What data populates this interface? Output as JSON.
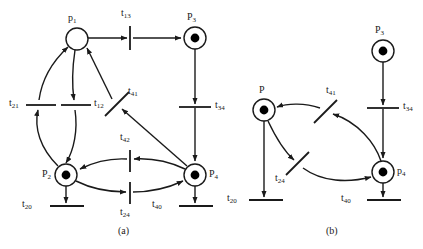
{
  "figure": {
    "type": "petri-net-diagram",
    "width": 423,
    "height": 249,
    "background": "#ffffff",
    "stroke_color": "#1a1a1a",
    "token_color": "#000000"
  },
  "panels": [
    {
      "id": "a",
      "caption": "(a)",
      "caption_pos": {
        "x": 120,
        "y": 232
      },
      "places": [
        {
          "id": "p1",
          "label": "p",
          "sub": "1",
          "cx": 77,
          "cy": 39,
          "r": 11,
          "tokens": 0,
          "label_pos": {
            "x": 68,
            "y": 16
          }
        },
        {
          "id": "p3",
          "label": "P",
          "sub": "3",
          "cx": 195,
          "cy": 38,
          "r": 11,
          "tokens": 1,
          "label_pos": {
            "x": 187,
            "y": 15
          }
        },
        {
          "id": "p2",
          "label": "P",
          "sub": "2",
          "cx": 66,
          "cy": 175,
          "r": 11,
          "tokens": 1,
          "label_pos": {
            "x": 42,
            "y": 171
          }
        },
        {
          "id": "p4",
          "label": "P",
          "sub": "4",
          "cx": 195,
          "cy": 175,
          "r": 11,
          "tokens": 1,
          "label_pos": {
            "x": 209,
            "y": 171
          }
        }
      ],
      "transitions": [
        {
          "id": "t13",
          "label": "t",
          "sub": "13",
          "x": 130,
          "y": 38,
          "orient": "vertical",
          "len": 24,
          "label_pos": {
            "x": 122,
            "y": 11
          }
        },
        {
          "id": "t34",
          "label": "t",
          "sub": "34",
          "x": 195,
          "y": 107,
          "orient": "horizontal",
          "len": 32,
          "label_pos": {
            "x": 212,
            "y": 101
          }
        },
        {
          "id": "t21",
          "label": "t",
          "sub": "21",
          "x": 41,
          "y": 105,
          "orient": "horizontal",
          "len": 30,
          "label_pos": {
            "x": 11,
            "y": 99
          }
        },
        {
          "id": "t12",
          "label": "t",
          "sub": "12",
          "x": 76,
          "y": 105,
          "orient": "horizontal",
          "len": 30,
          "label_pos": {
            "x": 93,
            "y": 99
          }
        },
        {
          "id": "t41",
          "label": "t",
          "sub": "41",
          "x": 117,
          "y": 104,
          "orient": "diagonal",
          "len": 28,
          "angle": -55,
          "label_pos": {
            "x": 126,
            "y": 90
          }
        },
        {
          "id": "t42",
          "label": "t",
          "sub": "42",
          "x": 130,
          "y": 161,
          "orient": "vertical",
          "len": 22,
          "label_pos": {
            "x": 121,
            "y": 135
          }
        },
        {
          "id": "t24",
          "label": "t",
          "sub": "24",
          "x": 130,
          "y": 193,
          "orient": "vertical",
          "len": 22,
          "label_pos": {
            "x": 121,
            "y": 210
          }
        },
        {
          "id": "t20",
          "label": "t",
          "sub": "20",
          "x": 66,
          "y": 206,
          "orient": "horizontal",
          "len": 32,
          "label_pos": {
            "x": 24,
            "y": 200
          }
        },
        {
          "id": "t40",
          "label": "t",
          "sub": "40",
          "x": 195,
          "y": 206,
          "orient": "horizontal",
          "len": 32,
          "label_pos": {
            "x": 156,
            "y": 200
          }
        }
      ]
    },
    {
      "id": "b",
      "caption": "(b)",
      "caption_pos": {
        "x": 328,
        "y": 232
      },
      "places": [
        {
          "id": "pb",
          "label": "P",
          "sub": "",
          "cx": 264,
          "cy": 110,
          "r": 11,
          "tokens": 1,
          "label_pos": {
            "x": 259,
            "y": 88
          }
        },
        {
          "id": "p3b",
          "label": "P",
          "sub": "3",
          "cx": 383,
          "cy": 51,
          "r": 11,
          "tokens": 1,
          "label_pos": {
            "x": 375,
            "y": 28
          }
        },
        {
          "id": "p4b",
          "label": "p",
          "sub": "4",
          "cx": 383,
          "cy": 172,
          "r": 11,
          "tokens": 1,
          "label_pos": {
            "x": 397,
            "y": 168
          }
        }
      ],
      "transitions": [
        {
          "id": "t34b",
          "label": "t",
          "sub": "34",
          "x": 383,
          "y": 108,
          "orient": "horizontal",
          "len": 32,
          "label_pos": {
            "x": 400,
            "y": 102
          }
        },
        {
          "id": "t41b",
          "label": "t",
          "sub": "41",
          "x": 325,
          "y": 111,
          "orient": "diagonal",
          "len": 28,
          "angle": -55,
          "label_pos": {
            "x": 325,
            "y": 89
          }
        },
        {
          "id": "t24b",
          "label": "t",
          "sub": "24",
          "x": 297,
          "y": 163,
          "orient": "diagonal",
          "len": 28,
          "angle": -55,
          "label_pos": {
            "x": 277,
            "y": 176
          }
        },
        {
          "id": "t20b",
          "label": "t",
          "sub": "20",
          "x": 266,
          "y": 200,
          "orient": "horizontal",
          "len": 32,
          "label_pos": {
            "x": 229,
            "y": 194
          }
        },
        {
          "id": "t40b",
          "label": "t",
          "sub": "40",
          "x": 383,
          "y": 200,
          "orient": "horizontal",
          "len": 32,
          "label_pos": {
            "x": 344,
            "y": 194
          }
        }
      ]
    }
  ],
  "arcs": {
    "count": 18,
    "description": "directed arcs connecting places and transitions"
  }
}
